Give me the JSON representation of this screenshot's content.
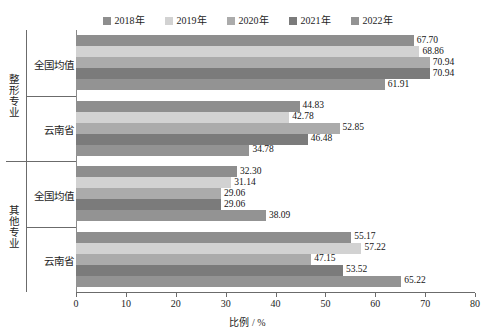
{
  "chart_data": {
    "type": "bar",
    "orientation": "horizontal",
    "title": "",
    "xlabel": "比例 / %",
    "ylabel": "",
    "xlim": [
      0,
      80
    ],
    "xticks": [
      0,
      10,
      20,
      30,
      40,
      50,
      60,
      70,
      80
    ],
    "grid": false,
    "legend_position": "top",
    "legend": [
      "2018年",
      "2019年",
      "2020年",
      "2021年",
      "2022年"
    ],
    "series": [
      {
        "name": "2018年",
        "color": "#8e8e8e",
        "values": [
          67.7,
          44.83,
          32.3,
          55.17
        ]
      },
      {
        "name": "2019年",
        "color": "#d2d2d2",
        "values": [
          68.86,
          42.78,
          31.14,
          57.22
        ]
      },
      {
        "name": "2020年",
        "color": "#ababab",
        "values": [
          70.94,
          52.85,
          29.06,
          47.15
        ]
      },
      {
        "name": "2021年",
        "color": "#7b7b7b",
        "values": [
          70.94,
          46.48,
          29.06,
          53.52
        ]
      },
      {
        "name": "2022年",
        "color": "#939393",
        "values": [
          61.91,
          34.78,
          38.09,
          65.22
        ]
      }
    ],
    "categories": [
      "全国均值",
      "云南省",
      "全国均值",
      "云南省"
    ],
    "category_groups": [
      {
        "label": "整形专业",
        "categories": [
          "全国均值",
          "云南省"
        ]
      },
      {
        "label": "其他专业",
        "categories": [
          "全国均值",
          "云南省"
        ]
      }
    ],
    "value_labels": [
      [
        "67.70",
        "68.86",
        "70.94",
        "70.94",
        "61.91"
      ],
      [
        "44.83",
        "42.78",
        "52.85",
        "46.48",
        "34.78"
      ],
      [
        "32.30",
        "31.14",
        "29.06",
        "29.06",
        "38.09"
      ],
      [
        "55.17",
        "57.22",
        "47.15",
        "53.52",
        "65.22"
      ]
    ],
    "xticklabels": [
      "0",
      "10",
      "20",
      "30",
      "40",
      "50",
      "60",
      "70",
      "80"
    ]
  }
}
